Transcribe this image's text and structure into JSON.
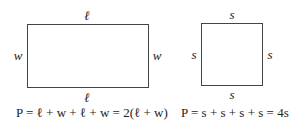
{
  "rectangle": {
    "top_label": "ℓ",
    "bottom_label": "ℓ",
    "left_label": "w",
    "right_label": "w",
    "formula": "P = ℓ + w + ℓ + w = 2(ℓ + w)"
  },
  "square": {
    "top_label": "s",
    "bottom_label": "s",
    "left_label": "s",
    "right_label": "s",
    "formula": "P = s + s + s + s = 4s"
  }
}
